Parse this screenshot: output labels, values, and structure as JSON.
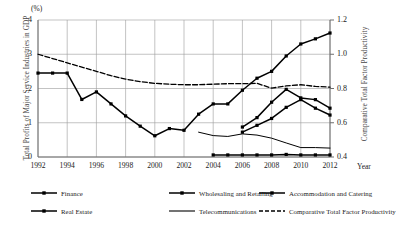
{
  "axes": {
    "unit_label": "(%)",
    "x_axis_label": "Year",
    "y_left_title": "Total Profits of Major Service Industries in GDP",
    "y_right_title": "Comparative Total Factor Productivity",
    "y_left_ticks": [
      "0",
      "1",
      "2",
      "3",
      "4"
    ],
    "y_right_ticks": [
      "0.4",
      "0.6",
      "0.8",
      "1.0",
      "1.2"
    ],
    "x_ticks": [
      "1992",
      "1994",
      "1996",
      "1998",
      "2000",
      "2002",
      "2004",
      "2006",
      "2008",
      "2010",
      "2012"
    ]
  },
  "legend": {
    "items": [
      {
        "label": "Finance",
        "key": "line-marker-square",
        "color": "#000000"
      },
      {
        "label": "Wholesaling and Retailing",
        "key": "line-marker-square",
        "color": "#000000"
      },
      {
        "label": "Accommodation and Catering",
        "key": "line-marker-square",
        "color": "#000000"
      },
      {
        "label": "Real Estate",
        "key": "line-marker-square",
        "color": "#000000"
      },
      {
        "label": "Telecommunications",
        "key": "line-plain",
        "color": "#000000"
      },
      {
        "label": "Comparative Total Factor Productivity",
        "key": "line-dashed",
        "color": "#000000"
      }
    ]
  },
  "chart_data": {
    "type": "line",
    "title": "",
    "xlabel": "Year",
    "ylabel": "Total Profits of Major Service Industries in GDP",
    "y2label": "Comparative Total Factor Productivity",
    "xlim": [
      1992,
      2012
    ],
    "ylim": [
      0,
      4
    ],
    "y2lim": [
      0.4,
      1.2
    ],
    "grid": true,
    "legend_position": "below",
    "x": [
      1992,
      1993,
      1994,
      1995,
      1996,
      1997,
      1998,
      1999,
      2000,
      2001,
      2002,
      2003,
      2004,
      2005,
      2006,
      2007,
      2008,
      2009,
      2010,
      2011,
      2012
    ],
    "series": [
      {
        "name": "Finance",
        "axis": "left",
        "marker": "square",
        "x": [
          1992,
          1993,
          1994,
          1995,
          1996,
          1997,
          1998,
          1999,
          2000,
          2001,
          2002,
          2003,
          2004,
          2005,
          2006,
          2007,
          2008,
          2009,
          2010,
          2011,
          2012
        ],
        "values": [
          2.45,
          2.45,
          2.45,
          1.68,
          1.9,
          1.55,
          1.2,
          0.9,
          0.62,
          0.83,
          0.78,
          1.25,
          1.55,
          1.55,
          1.95,
          2.3,
          2.5,
          2.95,
          3.3,
          3.45,
          3.62
        ]
      },
      {
        "name": "Wholesaling and Retailing",
        "axis": "right",
        "marker": "square",
        "x": [
          2006,
          2007,
          2008,
          2009,
          2010,
          2011,
          2012
        ],
        "values": [
          0.575,
          0.63,
          0.72,
          0.795,
          0.745,
          0.735,
          0.685
        ]
      },
      {
        "name": "Real Estate",
        "axis": "right",
        "marker": "square",
        "x": [
          2006,
          2007,
          2008,
          2009,
          2010,
          2011,
          2012
        ],
        "values": [
          0.545,
          0.585,
          0.625,
          0.69,
          0.735,
          0.685,
          0.645
        ]
      },
      {
        "name": "Accommodation and Catering",
        "axis": "right",
        "marker": "square",
        "x": [
          2004,
          2005,
          2006,
          2007,
          2008,
          2009,
          2010,
          2011,
          2012
        ],
        "values": [
          0.412,
          0.412,
          0.412,
          0.412,
          0.412,
          0.415,
          0.412,
          0.412,
          0.412
        ]
      },
      {
        "name": "Telecommunications",
        "axis": "right",
        "marker": "none",
        "x": [
          2003,
          2004,
          2005,
          2006,
          2007,
          2008,
          2009,
          2010,
          2011,
          2012
        ],
        "values": [
          0.545,
          0.525,
          0.52,
          0.535,
          0.528,
          0.51,
          0.482,
          0.455,
          0.455,
          0.452
        ]
      },
      {
        "name": "Comparative Total Factor Productivity",
        "axis": "right",
        "marker": "none",
        "style": "dashed",
        "x": [
          1992,
          1993,
          1994,
          1995,
          1996,
          1997,
          1998,
          1999,
          2000,
          2001,
          2002,
          2003,
          2004,
          2005,
          2006,
          2007,
          2008,
          2009,
          2010,
          2011,
          2012
        ],
        "values": [
          1.0,
          0.975,
          0.95,
          0.925,
          0.9,
          0.875,
          0.855,
          0.84,
          0.83,
          0.825,
          0.822,
          0.822,
          0.825,
          0.828,
          0.828,
          0.83,
          0.802,
          0.815,
          0.822,
          0.812,
          0.808
        ]
      }
    ]
  },
  "colors": {
    "line": "#000000",
    "grid": "#9a9a9a",
    "axis": "#6e6e6e",
    "text": "#1a1a1a"
  }
}
